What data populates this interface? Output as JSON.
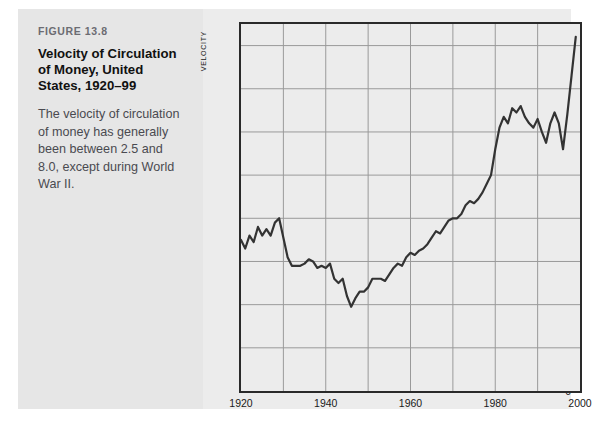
{
  "caption": {
    "figure_number": "FIGURE 13.8",
    "title": "Velocity of Circulation of Money, United States, 1920–99",
    "description": "The velocity of circulation of money has generally been between 2.5 and 8.0, except during World War II."
  },
  "colors": {
    "panel_background": "#e6e6e6",
    "figure_background": "#ececec",
    "line": "#333333",
    "gridline": "#9a9a9a",
    "frame": "#2a2a2a",
    "text": "#1a1a1a",
    "figure_number_text": "#6c6c72"
  },
  "chart_data": {
    "type": "line",
    "title": "Velocity of Circulation of Money, United States, 1920–99",
    "xlabel": "",
    "ylabel": "VELOCITY",
    "xlim": [
      1920,
      2000
    ],
    "ylim": [
      0,
      8.5
    ],
    "grid": true,
    "legend": null,
    "y_ticks": [
      0,
      1.0,
      2.0,
      3.0,
      4.0,
      5.0,
      6.0,
      7.0,
      8.0
    ],
    "y_tick_labels": [
      "0",
      "1.0",
      "2.0",
      "3.0",
      "4.0",
      "5.0",
      "6.0",
      "7.0",
      "8.0"
    ],
    "x_ticks": [
      1920,
      1930,
      1940,
      1950,
      1960,
      1970,
      1980,
      1990,
      2000
    ],
    "x_tick_labels": [
      "1920",
      "",
      "1940",
      "",
      "1960",
      "",
      "1980",
      "",
      "2000"
    ],
    "series": [
      {
        "name": "Velocity of circulation",
        "x": [
          1920,
          1921,
          1922,
          1923,
          1924,
          1925,
          1926,
          1927,
          1928,
          1929,
          1930,
          1931,
          1932,
          1933,
          1934,
          1935,
          1936,
          1937,
          1938,
          1939,
          1940,
          1941,
          1942,
          1943,
          1944,
          1945,
          1946,
          1947,
          1948,
          1949,
          1950,
          1951,
          1952,
          1953,
          1954,
          1955,
          1956,
          1957,
          1958,
          1959,
          1960,
          1961,
          1962,
          1963,
          1964,
          1965,
          1966,
          1967,
          1968,
          1969,
          1970,
          1971,
          1972,
          1973,
          1974,
          1975,
          1976,
          1977,
          1978,
          1979,
          1980,
          1981,
          1982,
          1983,
          1984,
          1985,
          1986,
          1987,
          1988,
          1989,
          1990,
          1991,
          1992,
          1993,
          1994,
          1995,
          1996,
          1997,
          1998,
          1999
        ],
        "values": [
          3.5,
          3.3,
          3.6,
          3.45,
          3.8,
          3.6,
          3.75,
          3.6,
          3.9,
          4.0,
          3.55,
          3.1,
          2.9,
          2.9,
          2.9,
          2.95,
          3.05,
          3.0,
          2.85,
          2.9,
          2.85,
          2.95,
          2.6,
          2.5,
          2.6,
          2.2,
          1.95,
          2.15,
          2.3,
          2.3,
          2.4,
          2.6,
          2.6,
          2.6,
          2.55,
          2.7,
          2.85,
          2.95,
          2.9,
          3.1,
          3.2,
          3.15,
          3.25,
          3.3,
          3.4,
          3.55,
          3.7,
          3.65,
          3.8,
          3.95,
          4.0,
          4.0,
          4.1,
          4.3,
          4.4,
          4.35,
          4.45,
          4.6,
          4.8,
          5.0,
          5.6,
          6.1,
          6.35,
          6.2,
          6.55,
          6.45,
          6.6,
          6.35,
          6.2,
          6.1,
          6.3,
          6.0,
          5.75,
          6.2,
          6.45,
          6.2,
          5.6,
          6.4,
          7.3,
          8.2
        ]
      }
    ]
  }
}
